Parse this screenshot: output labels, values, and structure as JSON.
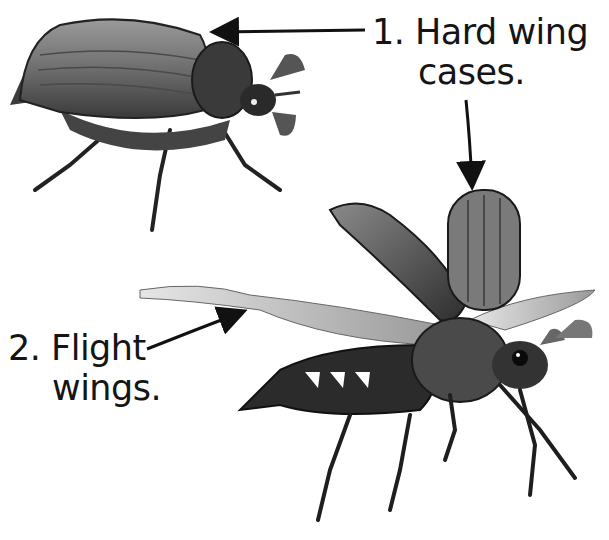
{
  "diagram": {
    "labels": [
      {
        "number": "1.",
        "line1": "1.  Hard wing",
        "line2": "cases.",
        "target": "elytra"
      },
      {
        "number": "2.",
        "line1": "2.  Flight",
        "line2": "wings.",
        "target": "hind-wings"
      }
    ],
    "figures": [
      {
        "name": "beetle-at-rest",
        "description": "Beetle walking with wing cases closed"
      },
      {
        "name": "beetle-in-flight",
        "description": "Beetle with wing cases raised and flight wings spread"
      }
    ],
    "colors": {
      "ink": "#151515",
      "background": "#ffffff",
      "shell": "#6a6a6a",
      "wing": "#c8c8c8"
    }
  }
}
